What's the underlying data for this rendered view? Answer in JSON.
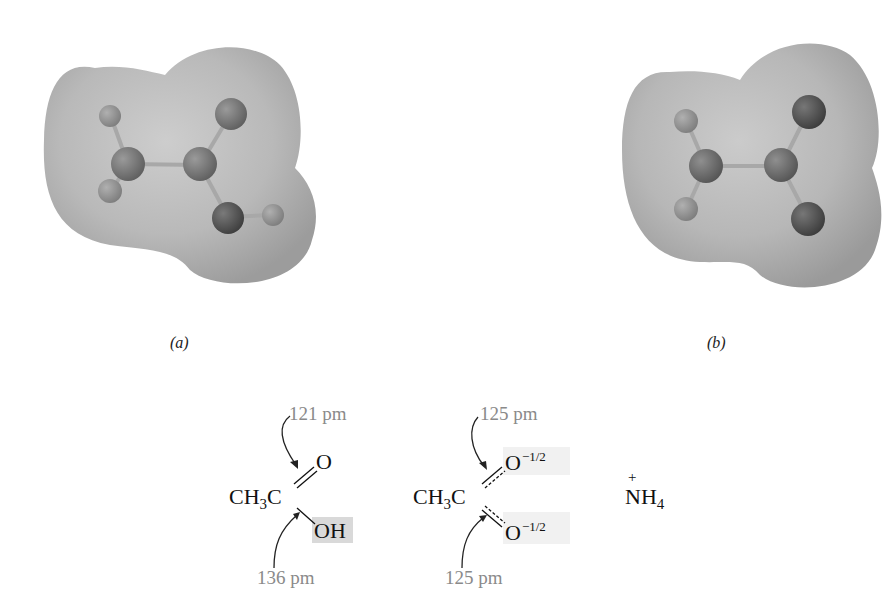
{
  "figure": {
    "panels": [
      {
        "id": "a",
        "caption": "(a)",
        "model": "electrostatic-potential-map-acetic-acid",
        "atoms": [
          "H",
          "H",
          "C",
          "C",
          "O",
          "O",
          "H"
        ]
      },
      {
        "id": "b",
        "caption": "(b)",
        "model": "electrostatic-potential-map-acetate-ion",
        "atoms": [
          "H",
          "H",
          "C",
          "C",
          "O",
          "O"
        ]
      }
    ],
    "structures": {
      "acetic_acid": {
        "prefix": "CH",
        "sub3": "3",
        "carbon": "C",
        "double_o": "O",
        "single_oh": "OH",
        "top_bond_label": "121 pm",
        "bottom_bond_label": "136 pm"
      },
      "acetate": {
        "prefix": "CH",
        "sub3": "3",
        "carbon": "C",
        "top_o": "O",
        "top_charge": "−1/2",
        "bottom_o": "O",
        "bottom_charge": "−1/2",
        "top_bond_label": "125 pm",
        "bottom_bond_label": "125 pm"
      },
      "ammonium": {
        "charge": "+",
        "n": "N",
        "h": "H",
        "sub4": "4"
      }
    },
    "colors": {
      "surface": "#b5b5b5",
      "atom_dark": "#5a5a5a",
      "atom_light": "#8e8e8e",
      "label_gray": "#8a8a8a",
      "highlight": "#d9d9d9"
    }
  }
}
